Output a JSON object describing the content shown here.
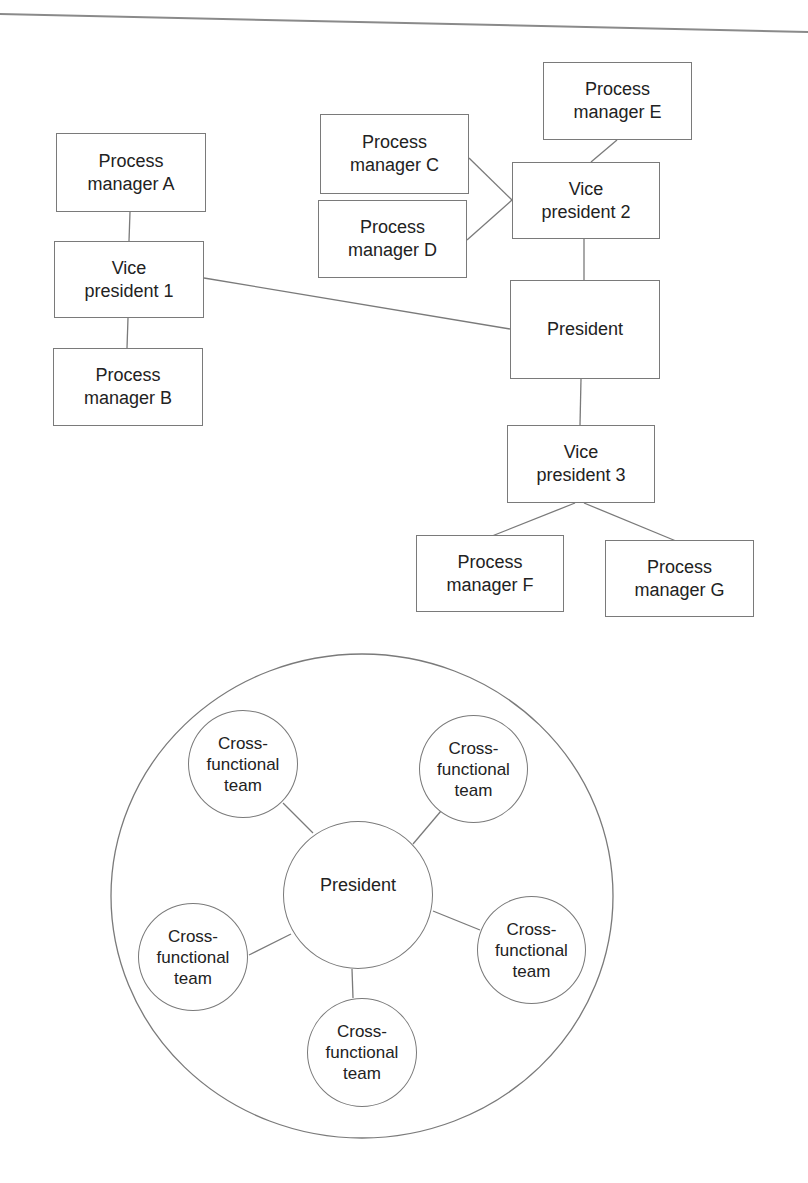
{
  "hierarchy_chart": {
    "nodes": {
      "pm_a": "Process\nmanager A",
      "vp1": "Vice\npresident 1",
      "pm_b": "Process\nmanager B",
      "pm_c": "Process\nmanager C",
      "pm_d": "Process\nmanager D",
      "pm_e": "Process\nmanager E",
      "vp2": "Vice\npresident 2",
      "president": "President",
      "vp3": "Vice\npresident 3",
      "pm_f": "Process\nmanager F",
      "pm_g": "Process\nmanager G"
    },
    "edges": [
      [
        "pm_a",
        "vp1"
      ],
      [
        "vp1",
        "pm_b"
      ],
      [
        "vp1",
        "president"
      ],
      [
        "pm_c",
        "vp2"
      ],
      [
        "pm_d",
        "vp2"
      ],
      [
        "pm_e",
        "vp2"
      ],
      [
        "vp2",
        "president"
      ],
      [
        "president",
        "vp3"
      ],
      [
        "vp3",
        "pm_f"
      ],
      [
        "vp3",
        "pm_g"
      ]
    ]
  },
  "team_chart": {
    "center": "President",
    "teams": [
      "Cross-\nfunctional\nteam",
      "Cross-\nfunctional\nteam",
      "Cross-\nfunctional\nteam",
      "Cross-\nfunctional\nteam",
      "Cross-\nfunctional\nteam"
    ]
  },
  "colors": {
    "line": "#7a7a7a",
    "text": "#222222",
    "background": "#ffffff"
  }
}
